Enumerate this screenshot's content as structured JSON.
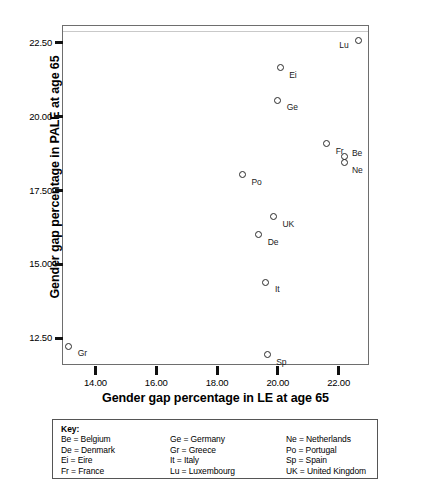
{
  "chart_data": {
    "type": "scatter",
    "title": "",
    "xlabel": "Gender gap percentage in LE at age 65",
    "ylabel": "Gender gap percentage in PALE at age 65",
    "xlim": [
      12.9,
      23.0
    ],
    "ylim": [
      11.6,
      23.1
    ],
    "xticks": [
      "14.00",
      "16.00",
      "18.00",
      "20.00",
      "22.00"
    ],
    "xtick_values": [
      14.0,
      16.0,
      18.0,
      20.0,
      22.0
    ],
    "yticks": [
      "12.50",
      "15.00",
      "17.50",
      "20.00",
      "22.50"
    ],
    "ytick_values": [
      12.5,
      15.0,
      17.5,
      20.0,
      22.5
    ],
    "grid": false,
    "legend": "none",
    "points": [
      {
        "code": "Lu",
        "name": "Luxembourg",
        "x": 22.65,
        "y": 22.56,
        "label_side": "left"
      },
      {
        "code": "Ei",
        "name": "Eire",
        "x": 20.08,
        "y": 21.65,
        "label_side": "right"
      },
      {
        "code": "Ge",
        "name": "Germany",
        "x": 20.0,
        "y": 20.56,
        "label_side": "right"
      },
      {
        "code": "Fr",
        "name": "France",
        "x": 21.61,
        "y": 19.09,
        "label_side": "right"
      },
      {
        "code": "Be",
        "name": "Belgium",
        "x": 22.21,
        "y": 18.64,
        "label_side": "right-up"
      },
      {
        "code": "Ne",
        "name": "Netherlands",
        "x": 22.21,
        "y": 18.45,
        "label_side": "right-down"
      },
      {
        "code": "Po",
        "name": "Portugal",
        "x": 18.84,
        "y": 18.04,
        "label_side": "right"
      },
      {
        "code": "UK",
        "name": "United Kingdom",
        "x": 19.86,
        "y": 16.62,
        "label_side": "right"
      },
      {
        "code": "De",
        "name": "Denmark",
        "x": 19.37,
        "y": 16.0,
        "label_side": "right"
      },
      {
        "code": "It",
        "name": "Italy",
        "x": 19.61,
        "y": 14.4,
        "label_side": "right"
      },
      {
        "code": "Gr",
        "name": "Greece",
        "x": 13.12,
        "y": 12.24,
        "label_side": "right"
      },
      {
        "code": "Sp",
        "name": "Spain",
        "x": 19.65,
        "y": 11.95,
        "label_side": "right"
      }
    ]
  },
  "key": {
    "title": "Key:",
    "columns": [
      [
        "Be = Belgium",
        "De = Denmark",
        "Ei = Eire",
        "Fr = France"
      ],
      [
        "Ge = Germany",
        "Gr = Greece",
        "It = Italy",
        "Lu = Luxembourg"
      ],
      [
        "Ne = Netherlands",
        "Po = Portugal",
        "Sp = Spain",
        "UK = United Kingdom"
      ]
    ]
  },
  "colors": {
    "frame": "#6e6e6e",
    "marker": "#2a2a2a",
    "text": "#000000",
    "background": "#ffffff"
  }
}
